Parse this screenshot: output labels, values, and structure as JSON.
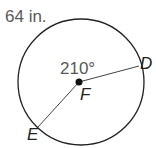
{
  "diagram": {
    "arc_length_label": "64 in.",
    "angle_label": "210°",
    "center_label": "F",
    "points": [
      {
        "label": "D"
      },
      {
        "label": "E"
      }
    ],
    "colors": {
      "stroke": "#222222",
      "label": "#595959"
    }
  }
}
